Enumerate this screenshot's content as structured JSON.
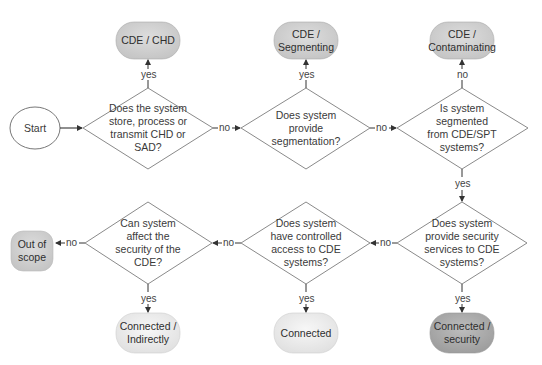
{
  "diagram": {
    "type": "flowchart",
    "colors": {
      "dark_terminal": "#a9a9a9",
      "medium_terminal": "#d2d2d2",
      "light_terminal": "#ececec",
      "line": "#555555",
      "diamond_stroke": "#8a8a8a"
    },
    "start": {
      "label": "Start"
    },
    "decisions": [
      {
        "id": "d1",
        "label": "Does the system\nstore, process or\ntransmit CHD or\nSAD?"
      },
      {
        "id": "d2",
        "label": "Does system\nprovide\nsegmentation?"
      },
      {
        "id": "d3",
        "label": "Is system\nsegmented\nfrom CDE/SPT\nsystems?"
      },
      {
        "id": "d4",
        "label": "Does system\nprovide security\nservices to CDE\nsystems?"
      },
      {
        "id": "d5",
        "label": "Does system\nhave controlled\naccess to CDE\nsystems?"
      },
      {
        "id": "d6",
        "label": "Can system\naffect the\nsecurity of the\nCDE?"
      }
    ],
    "terminals": [
      {
        "id": "t1",
        "label": "CDE / CHD"
      },
      {
        "id": "t2",
        "label": "CDE /\nSegmenting"
      },
      {
        "id": "t3",
        "label": "CDE /\nContaminating"
      },
      {
        "id": "t4",
        "label": "Connected /\nsecurity"
      },
      {
        "id": "t5",
        "label": "Connected"
      },
      {
        "id": "t6",
        "label": "Connected /\nIndirectly"
      },
      {
        "id": "t7",
        "label": "Out of\nscope"
      }
    ],
    "edges": [
      {
        "from": "start",
        "to": "d1",
        "label": ""
      },
      {
        "from": "d1",
        "to": "t1",
        "label": "yes"
      },
      {
        "from": "d1",
        "to": "d2",
        "label": "no"
      },
      {
        "from": "d2",
        "to": "t2",
        "label": "yes"
      },
      {
        "from": "d2",
        "to": "d3",
        "label": "no"
      },
      {
        "from": "d3",
        "to": "t3",
        "label": "no"
      },
      {
        "from": "d3",
        "to": "d4",
        "label": "yes"
      },
      {
        "from": "d4",
        "to": "t4",
        "label": "yes"
      },
      {
        "from": "d4",
        "to": "d5",
        "label": "no"
      },
      {
        "from": "d5",
        "to": "t5",
        "label": "yes"
      },
      {
        "from": "d5",
        "to": "d6",
        "label": "no"
      },
      {
        "from": "d6",
        "to": "t6",
        "label": "yes"
      },
      {
        "from": "d6",
        "to": "t7",
        "label": "no"
      }
    ]
  }
}
